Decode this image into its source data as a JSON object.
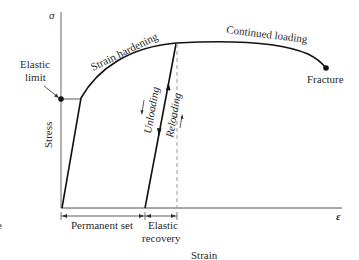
{
  "figure": {
    "type": "stress-strain diagram",
    "axes": {
      "y_symbol": "σ",
      "x_symbol": "ε",
      "y_label": "Stress",
      "x_label": "Strain"
    },
    "annotations": {
      "elastic_limit": [
        "Elastic",
        "limit"
      ],
      "strain_hardening": "Strain hardening",
      "continued_loading": "Continued loading",
      "fracture": "Fracture",
      "unloading": "Unloading",
      "reloading": "Reloading",
      "permanent_set": "Permanent set",
      "elastic_recovery": [
        "Elastic",
        "recovery"
      ],
      "edge_fragment": "e"
    },
    "colors": {
      "curve": "#111111",
      "axis": "#8a8a8a",
      "text": "#2a2a2a",
      "dashed": "#9a9a9a"
    }
  }
}
